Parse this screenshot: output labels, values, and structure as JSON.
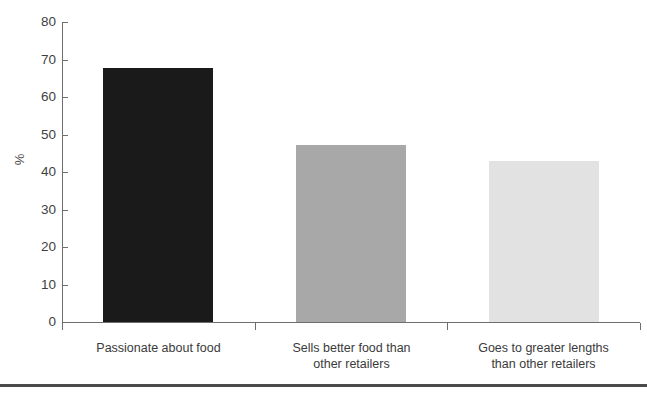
{
  "chart_data": {
    "type": "bar",
    "title": "",
    "xlabel": "",
    "ylabel": "%",
    "categories": [
      "Passionate about food",
      "Sells better food than other retailers",
      "Goes to greater lengths than other retailers"
    ],
    "category_lines": [
      [
        "Passionate about food"
      ],
      [
        "Sells better food than",
        "other retailers"
      ],
      [
        "Goes to greater lengths",
        "than other retailers"
      ]
    ],
    "values": [
      67.7,
      47.3,
      43.0
    ],
    "ylim": [
      0,
      80
    ],
    "yticks": [
      0,
      10,
      20,
      30,
      40,
      50,
      60,
      70,
      80
    ],
    "ytick_labels": [
      "0",
      "10",
      "20",
      "30",
      "40",
      "50",
      "60",
      "70",
      "80"
    ],
    "grid": false,
    "legend": "none",
    "bar_colors": [
      "#1a1a1a",
      "#a8a8a8",
      "#e2e2e2"
    ]
  },
  "axis": {
    "y_title": "%",
    "line_color": "#6e6e6e"
  },
  "decor": {
    "bottom_rule_color": "#4a4a4a"
  }
}
